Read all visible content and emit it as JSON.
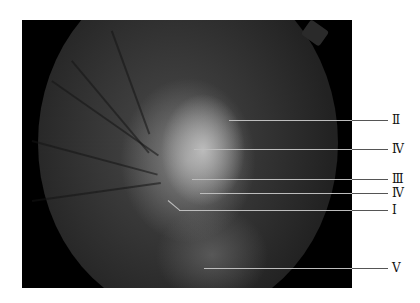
{
  "figure": {
    "type": "fundus-photograph",
    "labels": [
      {
        "id": "II",
        "text": "Ⅱ",
        "y": 120,
        "line_start_x": 229
      },
      {
        "id": "IV-a",
        "text": "Ⅳ",
        "y": 149,
        "line_start_x": 194
      },
      {
        "id": "III",
        "text": "Ⅲ",
        "y": 179,
        "line_start_x": 192
      },
      {
        "id": "IV-b",
        "text": "Ⅳ",
        "y": 193,
        "line_start_x": 200
      },
      {
        "id": "I",
        "text": "Ⅰ",
        "y": 210,
        "line_start_x": 180
      },
      {
        "id": "V",
        "text": "Ⅴ",
        "y": 268,
        "line_start_x": 204
      }
    ],
    "colors": {
      "background": "#000000",
      "leader_inside": "#bdbdbd",
      "leader_outside": "#555555",
      "label_text": "#111111"
    }
  }
}
